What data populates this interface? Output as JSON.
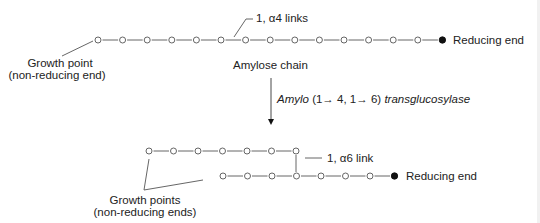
{
  "colors": {
    "line": "#555555",
    "text": "#222222",
    "filled": "#111111",
    "background": "#ffffff"
  },
  "top": {
    "links_label": "1, α4 links",
    "chain_label": "Amylose chain",
    "growth_label_line1": "Growth point",
    "growth_label_line2": "(non-reducing end)",
    "reducing_label": "Reducing end",
    "chain": {
      "y": 40,
      "x_start": 98,
      "spacing": 24.6,
      "open_count": 14
    }
  },
  "enzyme": {
    "label_italic": "Amylo",
    "label_mid": " (1→ 4, 1→ 6) ",
    "label_italic2": "transglucosylase"
  },
  "bottom": {
    "link_label": "1, α6 link",
    "reducing_label": "Reducing end",
    "growth_label_line1": "Growth points",
    "growth_label_line2": "(non-reducing ends)",
    "upper_chain": {
      "y": 151,
      "x_start": 149,
      "spacing": 24.5,
      "count": 7
    },
    "lower_chain": {
      "y": 176,
      "x_start": 223,
      "spacing": 24.5,
      "open_count": 7
    }
  }
}
